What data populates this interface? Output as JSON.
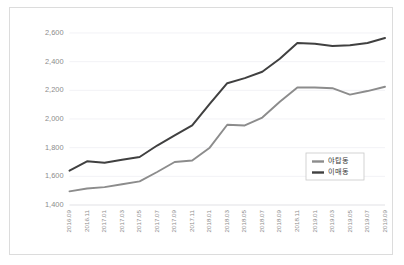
{
  "chart_data": {
    "type": "line",
    "title": "",
    "xlabel": "",
    "ylabel": "",
    "ylim": [
      1400,
      2600
    ],
    "yticks": [
      "1,400",
      "1,600",
      "1,800",
      "2,000",
      "2,200",
      "2,400",
      "2,600"
    ],
    "ytick_values": [
      1400,
      1600,
      1800,
      2000,
      2200,
      2400,
      2600
    ],
    "grid": true,
    "legend_position": "lower-right",
    "categories": [
      "2016.09",
      "2016.11",
      "2017.01",
      "2017.03",
      "2017.05",
      "2017.07",
      "2017.09",
      "2017.11",
      "2018.01",
      "2018.03",
      "2018.05",
      "2018.07",
      "2018.09",
      "2018.11",
      "2019.01",
      "2019.03",
      "2019.05",
      "2019.07",
      "2019.09"
    ],
    "series": [
      {
        "name": "야탑동",
        "color": "#8c8c8c",
        "values": [
          1495,
          1515,
          1525,
          1545,
          1565,
          1630,
          1700,
          1710,
          1800,
          1960,
          1955,
          2010,
          2120,
          2220,
          2220,
          2215,
          2170,
          2195,
          2225
        ]
      },
      {
        "name": "이매동",
        "color": "#404040",
        "values": [
          1640,
          1705,
          1695,
          1715,
          1735,
          1815,
          1885,
          1955,
          2105,
          2250,
          2285,
          2330,
          2420,
          2530,
          2525,
          2510,
          2515,
          2530,
          2565
        ]
      }
    ]
  },
  "legend": {
    "entries": [
      {
        "label": "야탑동"
      },
      {
        "label": "이매동"
      }
    ]
  }
}
